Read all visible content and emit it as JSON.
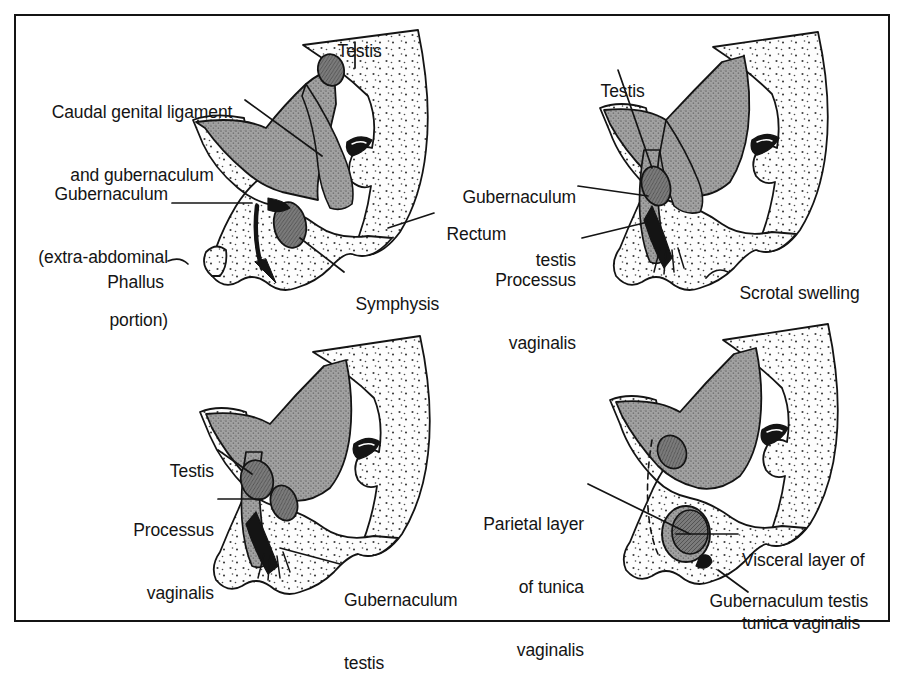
{
  "figure": {
    "kind": "anatomical-line-diagram",
    "panel_count": 4,
    "frame_color": "#141414",
    "background_color": "#ffffff",
    "ink_color": "#141414",
    "fill_tones": {
      "stipple_light": "#fbfbfb",
      "shade_medium_gray": "#9a9a9a",
      "shade_dark_gray": "#6f6f6f",
      "solid_black": "#141414"
    }
  },
  "panels": [
    {
      "id": "panel-top-left",
      "position": "top-left",
      "stage": 1,
      "labels": [
        {
          "id": "tl-testis",
          "text": "Testis",
          "align": "center",
          "leader": "vertical-down"
        },
        {
          "id": "tl-caudal-genital-ligament",
          "text": "Caudal genital ligament\nand gubernaculum",
          "align": "center",
          "leader": "down-right"
        },
        {
          "id": "tl-gubernaculum-extra-abdominal",
          "text": "Gubernaculum\n(extra-abdominal\nportion)",
          "align": "right",
          "leader": "right"
        },
        {
          "id": "tl-phallus",
          "text": "Phallus",
          "align": "right",
          "leader": "right-hook"
        },
        {
          "id": "tl-symphysis",
          "text": "Symphysis",
          "align": "left",
          "leader": "up-left"
        },
        {
          "id": "tl-rectum",
          "text": "Rectum",
          "align": "left",
          "leader": "left"
        }
      ]
    },
    {
      "id": "panel-top-right",
      "position": "top-right",
      "stage": 2,
      "labels": [
        {
          "id": "tr-testis",
          "text": "Testis",
          "align": "center",
          "leader": "down-right"
        },
        {
          "id": "tr-gubernaculum-testis",
          "text": "Gubernaculum\ntestis",
          "align": "right",
          "leader": "right"
        },
        {
          "id": "tr-processus-vaginalis",
          "text": "Processus\nvaginalis",
          "align": "right",
          "leader": "up-right"
        },
        {
          "id": "tr-scrotal-swelling",
          "text": "Scrotal swelling",
          "align": "left",
          "leader": "left-hook"
        }
      ]
    },
    {
      "id": "panel-bottom-left",
      "position": "bottom-left",
      "stage": 3,
      "labels": [
        {
          "id": "bl-testis",
          "text": "Testis",
          "align": "right",
          "leader": "down-right"
        },
        {
          "id": "bl-processus-vaginalis",
          "text": "Processus\nvaginalis",
          "align": "right",
          "leader": "right"
        },
        {
          "id": "bl-gubernaculum-testis",
          "text": "Gubernaculum\ntestis",
          "align": "left",
          "leader": "up-left"
        }
      ]
    },
    {
      "id": "panel-bottom-right",
      "position": "bottom-right",
      "stage": 4,
      "labels": [
        {
          "id": "br-parietal-layer",
          "text": "Parietal layer\nof tunica\nvaginalis",
          "align": "right",
          "leader": "right-down"
        },
        {
          "id": "br-visceral-layer",
          "text": "Visceral layer of\ntunica vaginalis",
          "align": "left",
          "leader": "left"
        },
        {
          "id": "br-gubernaculum-testis",
          "text": "Gubernaculum testis",
          "align": "left",
          "leader": "up-left"
        }
      ]
    }
  ],
  "label_text": {
    "testis": "Testis",
    "caudal_genital_ligament_line1": "Caudal genital ligament",
    "caudal_genital_ligament_line2": "and gubernaculum",
    "gubernaculum_line1": "Gubernaculum",
    "gubernaculum_line2": "(extra-abdominal",
    "gubernaculum_line3": "portion)",
    "phallus": "Phallus",
    "symphysis": "Symphysis",
    "rectum": "Rectum",
    "gubernaculum_testis_line1": "Gubernaculum",
    "gubernaculum_testis_line2": "testis",
    "processus_vaginalis_line1": "Processus",
    "processus_vaginalis_line2": "vaginalis",
    "scrotal_swelling": "Scrotal swelling",
    "parietal_layer_line1": "Parietal layer",
    "parietal_layer_line2": "of tunica",
    "parietal_layer_line3": "vaginalis",
    "visceral_layer_line1": "Visceral layer of",
    "visceral_layer_line2": "tunica vaginalis",
    "gubernaculum_testis_full": "Gubernaculum testis"
  }
}
